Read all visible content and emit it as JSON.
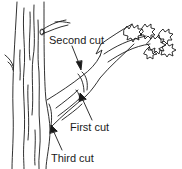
{
  "diagram": {
    "labels": [
      {
        "id": "second",
        "text": "Second cut"
      },
      {
        "id": "first",
        "text": "First cut"
      },
      {
        "id": "third",
        "text": "Third cut"
      }
    ],
    "colors": {
      "line": "#1a1a1a",
      "background": "#ffffff"
    }
  }
}
